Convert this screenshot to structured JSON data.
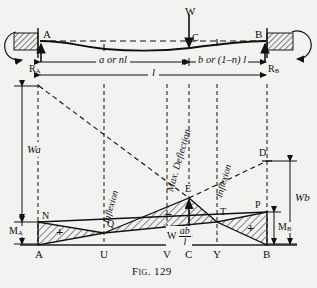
{
  "figure": {
    "caption": "Fig. 129",
    "background_color": "#f2f2f0",
    "ink_color": "#111111"
  },
  "beam": {
    "load_label": "W",
    "support_left_label": "A",
    "support_right_label": "B",
    "load_point_label": "C",
    "reaction_left_label": "R",
    "reaction_left_sub": "A",
    "reaction_right_label": "R",
    "reaction_right_sub": "B"
  },
  "dimensions": {
    "span_a": "a or nl",
    "span_b": "b or (1–n) l",
    "span_total": "l"
  },
  "diagram_labels": {
    "wa": "Wa",
    "wb": "Wb",
    "moment_a": "M",
    "moment_a_sub": "A",
    "moment_b": "M",
    "moment_b_sub": "B",
    "max_deflection": "Max. Deflection",
    "inflexion_left": "Inflexion",
    "inflexion_right": "Inflexion",
    "free_moment_prefix": "W",
    "free_moment_num": "ab",
    "free_moment_den": "l",
    "plus_left": "+",
    "plus_right": "+",
    "minus_middle": "–"
  },
  "points": {
    "N": "N",
    "Q": "Q",
    "E": "E",
    "T": "T",
    "P": "P",
    "D": "D"
  },
  "baseline_stations": [
    {
      "key": "A",
      "label": "A",
      "x": 38
    },
    {
      "key": "U",
      "label": "U",
      "x": 104
    },
    {
      "key": "V",
      "label": "V",
      "x": 167
    },
    {
      "key": "C",
      "label": "C",
      "x": 189
    },
    {
      "key": "Y",
      "label": "Y",
      "x": 217
    },
    {
      "key": "B",
      "label": "B",
      "x": 267
    }
  ]
}
